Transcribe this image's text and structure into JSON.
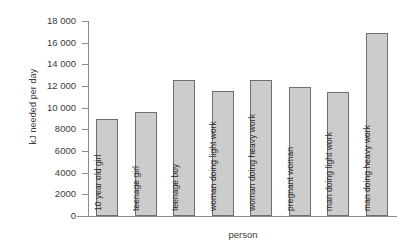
{
  "chart_data": {
    "type": "bar",
    "title": "",
    "xlabel": "person",
    "ylabel": "kJ needed per day",
    "ylim": [
      0,
      18000
    ],
    "ytick_step": 2000,
    "grid": false,
    "legend": null,
    "axis_color": "#8a8a8a",
    "bar_fill": "#cccccc",
    "bar_stroke": "#6e6e6e",
    "categories": [
      "10 year old girl",
      "teenage girl",
      "teenage boy",
      "woman doing light work",
      "woman doing heavy work",
      "pregnant woman",
      "man doing light work",
      "man doing heavy work"
    ],
    "values": [
      9000,
      9600,
      12600,
      11500,
      12600,
      11950,
      11450,
      16850
    ],
    "ytick_labels": [
      "18 000",
      "16 000",
      "14 000",
      "12 000",
      "10 000",
      "8000",
      "6000",
      "4000",
      "2000",
      "0"
    ],
    "ytick_values": [
      18000,
      16000,
      14000,
      12000,
      10000,
      8000,
      6000,
      4000,
      2000,
      0
    ]
  }
}
